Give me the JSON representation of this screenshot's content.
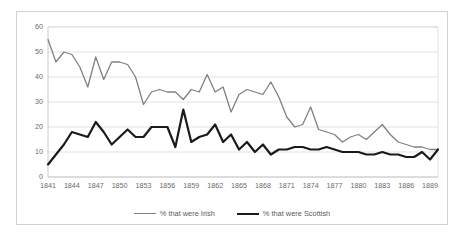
{
  "chart_data": {
    "type": "line",
    "title": "",
    "xlabel": "",
    "ylabel": "",
    "ylim": [
      0,
      60
    ],
    "ytick_values": [
      0,
      10,
      20,
      30,
      40,
      50,
      60
    ],
    "ytick_labels": [
      "0",
      "10",
      "20",
      "30",
      "40",
      "50",
      "60"
    ],
    "grid": true,
    "grid_axis": "y",
    "legend_position": "bottom-center",
    "x": [
      1841,
      1842,
      1843,
      1844,
      1845,
      1846,
      1847,
      1848,
      1849,
      1850,
      1851,
      1852,
      1853,
      1854,
      1855,
      1856,
      1857,
      1858,
      1859,
      1860,
      1861,
      1862,
      1863,
      1864,
      1865,
      1866,
      1867,
      1868,
      1869,
      1870,
      1871,
      1872,
      1873,
      1874,
      1875,
      1876,
      1877,
      1878,
      1879,
      1880,
      1881,
      1882,
      1883,
      1884,
      1885,
      1886,
      1887,
      1888,
      1889,
      1890
    ],
    "xtick_labels": [
      "1841",
      "1844",
      "1847",
      "1850",
      "1853",
      "1856",
      "1859",
      "1862",
      "1865",
      "1868",
      "1871",
      "1874",
      "1877",
      "1880",
      "1883",
      "1886",
      "1889"
    ],
    "xtick_values": [
      1841,
      1844,
      1847,
      1850,
      1853,
      1856,
      1859,
      1862,
      1865,
      1868,
      1871,
      1874,
      1877,
      1880,
      1883,
      1886,
      1889
    ],
    "series": [
      {
        "name": "% that were Irish",
        "color": "#808080",
        "width": 1.3,
        "values": [
          55,
          46,
          50,
          49,
          44,
          36,
          48,
          39,
          46,
          46,
          45,
          40,
          29,
          34,
          35,
          34,
          34,
          31,
          35,
          34,
          41,
          34,
          36,
          26,
          33,
          35,
          34,
          33,
          38,
          32,
          24,
          20,
          21,
          28,
          19,
          18,
          17,
          14,
          16,
          17,
          15,
          18,
          21,
          17,
          14,
          13,
          12,
          12,
          11,
          11
        ]
      },
      {
        "name": "% that were Scottish",
        "color": "#1a1a1a",
        "width": 2.2,
        "values": [
          5,
          9,
          13,
          18,
          17,
          16,
          22,
          18,
          13,
          16,
          19,
          16,
          16,
          20,
          20,
          20,
          12,
          27,
          14,
          16,
          17,
          21,
          14,
          17,
          11,
          14,
          10,
          13,
          9,
          11,
          11,
          12,
          12,
          11,
          11,
          12,
          11,
          10,
          10,
          10,
          9,
          9,
          10,
          9,
          9,
          8,
          8,
          10,
          7,
          11
        ]
      }
    ]
  },
  "legend": {
    "entries": [
      {
        "label": "% that were Irish"
      },
      {
        "label": "% that were Scottish"
      }
    ]
  }
}
